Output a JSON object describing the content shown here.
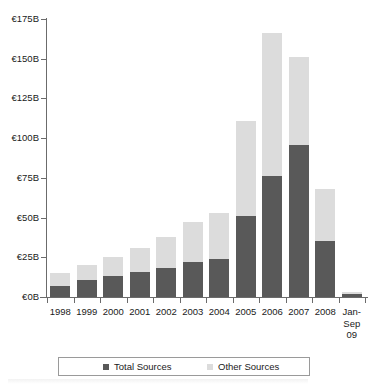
{
  "chart_data": {
    "type": "bar",
    "stacked": true,
    "title": "",
    "subtitle": "",
    "xlabel": "",
    "ylabel": "",
    "ylim": [
      0,
      175
    ],
    "ytick_values": [
      0,
      25,
      50,
      75,
      100,
      125,
      150,
      175
    ],
    "ytick_labels": [
      "€0B",
      "€25B",
      "€50B",
      "€75B",
      "€100B",
      "€125B",
      "€150B",
      "€175B"
    ],
    "grid": false,
    "legend_position": "bottom",
    "currency_symbol": "€",
    "unit": "B",
    "categories": [
      "1998",
      "1999",
      "2000",
      "2001",
      "2002",
      "2003",
      "2004",
      "2005",
      "2006",
      "2007",
      "2008",
      "Jan-\nSep\n09"
    ],
    "category_labels_flat": [
      "1998",
      "1999",
      "2000",
      "2001",
      "2002",
      "2003",
      "2004",
      "2005",
      "2006",
      "2007",
      "2008",
      "Jan-Sep 09"
    ],
    "series": [
      {
        "name": "Total Sources",
        "color": "#595959",
        "values": [
          7,
          11,
          13,
          16,
          18,
          22,
          24,
          51,
          76,
          96,
          35,
          2
        ]
      },
      {
        "name": "Other Sources",
        "color": "#dcdcdc",
        "values": [
          8,
          9,
          12,
          15,
          20,
          25,
          29,
          60,
          90,
          55,
          33,
          1
        ]
      }
    ],
    "stack_totals": [
      15,
      20,
      25,
      31,
      38,
      47,
      53,
      111,
      166,
      151,
      68,
      3
    ]
  },
  "legend": {
    "entries": [
      {
        "label": "Total Sources",
        "swatch": "total"
      },
      {
        "label": "Other Sources",
        "swatch": "other"
      }
    ]
  },
  "colors": {
    "total_sources": "#595959",
    "other_sources": "#dcdcdc",
    "axis": "#6b6b6b",
    "text": "#1a1a1a",
    "background": "#ffffff"
  }
}
